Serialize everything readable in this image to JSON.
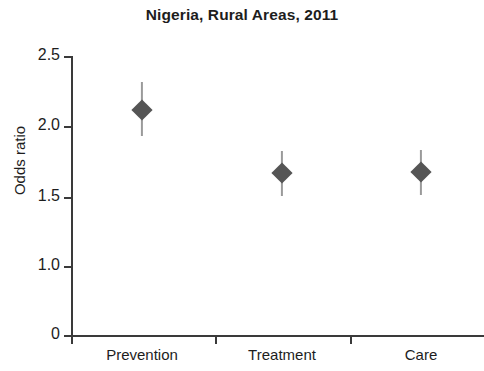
{
  "chart": {
    "title": "Nigeria, Rural Areas, 2011",
    "ylabel": "Odds ratio",
    "xlabel": ""
  },
  "chart_data": {
    "type": "scatter",
    "title": "Nigeria, Rural Areas, 2011",
    "subtitle": "",
    "xlabel": "",
    "ylabel": "Odds ratio",
    "categories": [
      "Prevention",
      "Treatment",
      "Care"
    ],
    "values": [
      2.09,
      1.65,
      1.66
    ],
    "error_low": [
      1.9,
      1.52,
      1.52
    ],
    "error_high": [
      2.29,
      1.8,
      1.81
    ],
    "marker": "diamond",
    "marker_color": "#555555",
    "errorbar_color": "#9a9a9a",
    "ylim": [
      0,
      2.5
    ],
    "ytick_labels": [
      "0",
      "1.0",
      "1.5",
      "2.0",
      "2.5"
    ],
    "ytick_values": [
      0,
      1.0,
      1.5,
      2.0,
      2.5
    ],
    "y_axis_note": "axis compressed between 0 and 1.0; 0.5 tick omitted",
    "grid": false,
    "legend": null,
    "annotations": []
  },
  "yticks": [
    {
      "label": "2.5",
      "value": 2.5,
      "py": 56
    },
    {
      "label": "2.0",
      "value": 2.0,
      "py": 126
    },
    {
      "label": "1.5",
      "value": 1.5,
      "py": 197
    },
    {
      "label": "1.0",
      "value": 1.0,
      "py": 266
    },
    {
      "label": "0",
      "value": 0,
      "py": 335
    }
  ],
  "xticks": [
    {
      "px": 71
    },
    {
      "px": 215
    },
    {
      "px": 350
    }
  ],
  "xcategories": [
    {
      "label": "Prevention",
      "px": 142
    },
    {
      "label": "Treatment",
      "px": 282
    },
    {
      "label": "Care",
      "px": 421
    }
  ],
  "points": [
    {
      "category": "Prevention",
      "value": 2.09,
      "low": 1.9,
      "high": 2.29,
      "px": 142,
      "py": 110,
      "bar_top": 82,
      "bar_height": 54
    },
    {
      "category": "Treatment",
      "value": 1.65,
      "low": 1.52,
      "high": 1.8,
      "px": 282,
      "py": 173,
      "bar_top": 151,
      "bar_height": 45
    },
    {
      "category": "Care",
      "value": 1.66,
      "low": 1.52,
      "high": 1.81,
      "px": 421,
      "py": 172,
      "bar_top": 150,
      "bar_height": 45
    }
  ]
}
